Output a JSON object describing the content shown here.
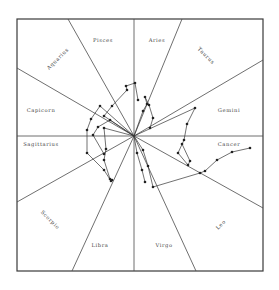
{
  "diagram": {
    "title": "",
    "frame": {
      "left": 17,
      "top": 19,
      "right": 263,
      "bottom": 271
    },
    "center": {
      "x": 134,
      "y": 136
    },
    "colors": {
      "line": "#3a3a3a",
      "text": "#444444",
      "background": "#ffffff"
    },
    "signs": [
      {
        "name": "Pisces",
        "label": "Pisces",
        "x": 103,
        "y": 42,
        "rotate": 0
      },
      {
        "name": "Aries",
        "label": "Aries",
        "x": 157,
        "y": 42,
        "rotate": 0
      },
      {
        "name": "Taurus",
        "label": "Taurus",
        "x": 205,
        "y": 57,
        "rotate": 45
      },
      {
        "name": "Gemini",
        "label": "Gemini",
        "x": 229,
        "y": 112,
        "rotate": 0
      },
      {
        "name": "Cancer",
        "label": "Cancer",
        "x": 229,
        "y": 146,
        "rotate": 0
      },
      {
        "name": "Leo",
        "label": "Leo",
        "x": 222,
        "y": 226,
        "rotate": -45
      },
      {
        "name": "Virgo",
        "label": "Virgo",
        "x": 164,
        "y": 247,
        "rotate": 0
      },
      {
        "name": "Libra",
        "label": "Libra",
        "x": 100,
        "y": 247,
        "rotate": 0
      },
      {
        "name": "Scorpio",
        "label": "Scorpio",
        "x": 49,
        "y": 221,
        "rotate": 45
      },
      {
        "name": "Sagittarius",
        "label": "Sagittarius",
        "x": 41,
        "y": 146,
        "rotate": 0
      },
      {
        "name": "Capricorn",
        "label": "Capicorn",
        "x": 41,
        "y": 112,
        "rotate": 0
      },
      {
        "name": "Aquarius",
        "label": "Aquarius",
        "x": 59,
        "y": 60,
        "rotate": -45
      }
    ],
    "dividers": [
      {
        "x2": 134,
        "y2": 19
      },
      {
        "x2": 134,
        "y2": 271
      },
      {
        "x2": 17,
        "y2": 136
      },
      {
        "x2": 263,
        "y2": 136
      },
      {
        "x2": 68,
        "y2": 19
      },
      {
        "x2": 182,
        "y2": 19
      },
      {
        "x2": 17,
        "y2": 68
      },
      {
        "x2": 263,
        "y2": 60
      },
      {
        "x2": 17,
        "y2": 202
      },
      {
        "x2": 263,
        "y2": 208
      },
      {
        "x2": 72,
        "y2": 271
      },
      {
        "x2": 196,
        "y2": 271
      }
    ],
    "tracks": [
      {
        "name": "track-upper-left-loop",
        "points": [
          [
            134,
            136
          ],
          [
            104,
            116
          ],
          [
            112,
            106
          ],
          [
            127,
            90
          ],
          [
            126,
            86
          ],
          [
            135,
            83
          ],
          [
            138,
            100
          ]
        ]
      },
      {
        "name": "track-left-loop-1",
        "points": [
          [
            134,
            136
          ],
          [
            100,
            106
          ],
          [
            91,
            119
          ],
          [
            87,
            130
          ],
          [
            87,
            153
          ],
          [
            104,
            170
          ],
          [
            111,
            181
          ]
        ]
      },
      {
        "name": "track-left-loop-2",
        "points": [
          [
            134,
            136
          ],
          [
            104,
            128
          ],
          [
            106,
            149
          ],
          [
            104,
            160
          ],
          [
            110,
            179
          ],
          [
            112,
            180
          ]
        ]
      },
      {
        "name": "track-left-loop-3",
        "points": [
          [
            134,
            136
          ],
          [
            110,
            120
          ],
          [
            98,
            127
          ],
          [
            93,
            135
          ],
          [
            104,
            154
          ]
        ]
      },
      {
        "name": "track-upper-right",
        "points": [
          [
            134,
            136
          ],
          [
            143,
            111
          ],
          [
            147,
            104
          ],
          [
            145,
            97
          ],
          [
            149,
            105
          ],
          [
            153,
            118
          ],
          [
            150,
            128
          ]
        ]
      },
      {
        "name": "track-gemini",
        "points": [
          [
            134,
            136
          ],
          [
            195,
            108
          ],
          [
            187,
            124
          ],
          [
            184,
            140
          ],
          [
            178,
            153
          ],
          [
            188,
            165
          ],
          [
            190,
            161
          ],
          [
            182,
            144
          ]
        ]
      },
      {
        "name": "track-lower-right",
        "points": [
          [
            134,
            136
          ],
          [
            143,
            150
          ],
          [
            148,
            166
          ],
          [
            153,
            187
          ],
          [
            200,
            173
          ],
          [
            205,
            171
          ],
          [
            217,
            160
          ],
          [
            232,
            152
          ],
          [
            250,
            148
          ]
        ]
      },
      {
        "name": "track-lower-center",
        "points": [
          [
            134,
            136
          ],
          [
            137,
            153
          ],
          [
            142,
            170
          ],
          [
            145,
            182
          ]
        ]
      }
    ]
  }
}
